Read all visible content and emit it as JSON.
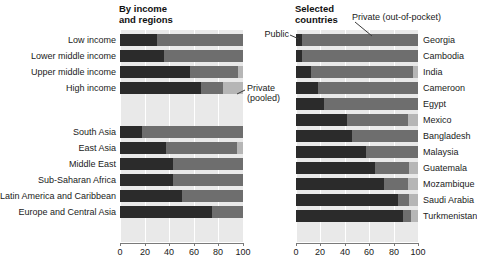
{
  "chart_data": {
    "type": "bar",
    "orientation": "horizontal",
    "stacked": true,
    "title": "",
    "xlabel": "",
    "ylabel": "",
    "xlim": [
      0,
      100
    ],
    "xticks": [
      0,
      20,
      40,
      60,
      80,
      100
    ],
    "xtick_labels": [
      "0",
      "20",
      "40",
      "60",
      "80",
      "100"
    ],
    "grid": true,
    "legend_position": "callouts",
    "series": [
      {
        "name": "Public",
        "color": "#2b2b2b"
      },
      {
        "name": "Private (pooled)",
        "color": "#6e6e6e"
      },
      {
        "name": "Private (out-of-pocket)",
        "color": "#b6b6b6"
      }
    ],
    "panels": [
      {
        "id": "by-income-and-regions",
        "title": "By income\nand regions",
        "groups": [
          {
            "id": "income",
            "categories": [
              "Low income",
              "Lower middle income",
              "Upper middle income",
              "High income"
            ],
            "values": [
              [
                30,
                70,
                0
              ],
              [
                36,
                64,
                0
              ],
              [
                57,
                39,
                4
              ],
              [
                66,
                18,
                16
              ]
            ]
          },
          {
            "id": "regions",
            "categories": [
              "South Asia",
              "East Asia",
              "Middle East",
              "Sub-Saharan Africa",
              "Latin America and Caribbean",
              "Europe and Central Asia"
            ],
            "values": [
              [
                18,
                82,
                0
              ],
              [
                37,
                58,
                5
              ],
              [
                43,
                57,
                0
              ],
              [
                43,
                57,
                0
              ],
              [
                50,
                50,
                0
              ],
              [
                75,
                25,
                0
              ]
            ]
          }
        ]
      },
      {
        "id": "selected-countries",
        "title": "Selected\ncountries",
        "groups": [
          {
            "id": "countries",
            "categories": [
              "Georgia",
              "Cambodia",
              "India",
              "Cameroon",
              "Egypt",
              "Mexico",
              "Bangladesh",
              "Malaysia",
              "Guatemala",
              "Mozambique",
              "Saudi Arabia",
              "Turkmenistan"
            ],
            "values": [
              [
                5,
                95,
                0
              ],
              [
                5,
                95,
                0
              ],
              [
                12,
                84,
                4
              ],
              [
                18,
                82,
                0
              ],
              [
                23,
                77,
                0
              ],
              [
                42,
                50,
                8
              ],
              [
                46,
                54,
                0
              ],
              [
                57,
                43,
                0
              ],
              [
                65,
                28,
                7
              ],
              [
                72,
                20,
                8
              ],
              [
                84,
                9,
                7
              ],
              [
                88,
                6,
                6
              ]
            ]
          }
        ]
      }
    ]
  },
  "panels": {
    "left": {
      "title": "By income\nand regions"
    },
    "right": {
      "title": "Selected\ncountries"
    }
  },
  "callouts": {
    "public": "Public",
    "pooled": "Private\n(pooled)",
    "oop": "Private (out-of-pocket)"
  },
  "axis": {
    "ticks": [
      "0",
      "20",
      "40",
      "60",
      "80",
      "100"
    ]
  },
  "labels": {
    "left": [
      "Low income",
      "Lower middle income",
      "Upper middle income",
      "High income",
      "South Asia",
      "East Asia",
      "Middle East",
      "Sub-Saharan Africa",
      "Latin America and Caribbean",
      "Europe and Central Asia"
    ],
    "right": [
      "Georgia",
      "Cambodia",
      "India",
      "Cameroon",
      "Egypt",
      "Mexico",
      "Bangladesh",
      "Malaysia",
      "Guatemala",
      "Mozambique",
      "Saudi Arabia",
      "Turkmenistan"
    ]
  },
  "colors": {
    "public": "#2b2b2b",
    "pooled": "#6e6e6e",
    "oop": "#b6b6b6",
    "plot_background": "#e9e9e9",
    "gridline": "#ffffff",
    "axis": "#7a7a7a",
    "text": "#1a1a1a"
  }
}
